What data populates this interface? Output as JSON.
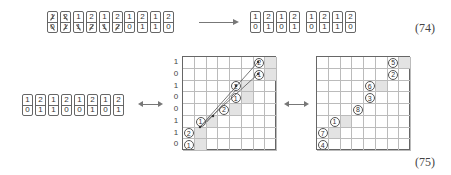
{
  "equation_74": {
    "label": "(74)",
    "left_strip_crossed": {
      "top": [
        "1",
        "2",
        "1",
        "2",
        "1",
        "2"
      ],
      "bottom": [
        "0",
        "1",
        "1",
        "2",
        "1",
        "2"
      ],
      "crossed_top": [
        true,
        true,
        false,
        false,
        false,
        false
      ],
      "crossed_bottom": [
        true,
        true,
        true,
        true,
        true,
        true
      ]
    },
    "left_strip_2": {
      "top": [
        "1",
        "2",
        "1",
        "2"
      ],
      "bottom": [
        "0",
        "1",
        "1",
        "0"
      ]
    },
    "arrow": "long-right-arrow",
    "right_strip_1": {
      "top": [
        "1",
        "2",
        "1",
        "2"
      ],
      "bottom": [
        "0",
        "1",
        "0",
        "1"
      ]
    },
    "right_strip_2": {
      "top": [
        "1",
        "2",
        "1",
        "2"
      ],
      "bottom": [
        "0",
        "1",
        "1",
        "0"
      ]
    }
  },
  "equation_75": {
    "label": "(75)",
    "strip": {
      "top": [
        "1",
        "2",
        "1",
        "2",
        "1",
        "2",
        "1",
        "2"
      ],
      "bottom": [
        "0",
        "1",
        "1",
        "0",
        "0",
        "1",
        "0",
        "1"
      ]
    },
    "arrow_left": "double-headed-arrow",
    "arrow_right": "double-headed-arrow",
    "middle_grid": {
      "rows": 8,
      "cols": 8,
      "row_labels": [
        "1",
        "0",
        "1",
        "0",
        "0",
        "1",
        "1",
        "0"
      ],
      "circles": [
        {
          "r": 0,
          "c": 6,
          "v": "2"
        },
        {
          "r": 1,
          "c": 6,
          "v": "1"
        },
        {
          "r": 2,
          "c": 4,
          "v": "2"
        },
        {
          "r": 3,
          "c": 4,
          "v": "1"
        },
        {
          "r": 4,
          "c": 3,
          "v": "2"
        },
        {
          "r": 5,
          "c": 1,
          "v": "1"
        },
        {
          "r": 6,
          "c": 0,
          "v": "2"
        },
        {
          "r": 7,
          "c": 0,
          "v": "1"
        }
      ],
      "shaded": [
        [
          0,
          7
        ],
        [
          1,
          7
        ],
        [
          2,
          5
        ],
        [
          3,
          5
        ],
        [
          4,
          4
        ],
        [
          5,
          2
        ],
        [
          6,
          1
        ],
        [
          7,
          1
        ]
      ]
    },
    "right_grid": {
      "rows": 8,
      "cols": 8,
      "circles": [
        {
          "r": 0,
          "c": 6,
          "v": "5"
        },
        {
          "r": 1,
          "c": 6,
          "v": "2"
        },
        {
          "r": 2,
          "c": 4,
          "v": "6"
        },
        {
          "r": 3,
          "c": 4,
          "v": "3"
        },
        {
          "r": 4,
          "c": 3,
          "v": "8"
        },
        {
          "r": 5,
          "c": 1,
          "v": "1"
        },
        {
          "r": 6,
          "c": 0,
          "v": "7"
        },
        {
          "r": 7,
          "c": 0,
          "v": "4"
        }
      ],
      "shaded": [
        [
          0,
          7
        ],
        [
          2,
          5
        ],
        [
          5,
          2
        ],
        [
          6,
          1
        ]
      ]
    }
  }
}
